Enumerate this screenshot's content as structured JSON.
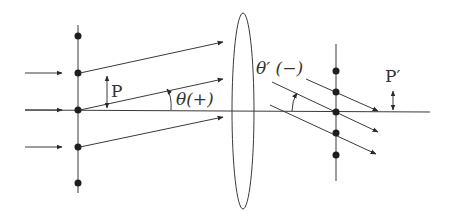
{
  "diagram": {
    "labels": {
      "period_object": "P",
      "angle_object": "θ(+)",
      "angle_image": "θ′ (−)",
      "period_image": "P′"
    },
    "colors": {
      "stroke": "#3a3a3a",
      "dot": "#1e1e1e",
      "background": "#ffffff"
    },
    "object_plane": {
      "x": 78,
      "dot_ys": [
        36,
        73,
        110,
        147,
        183
      ],
      "incident_arrow_ys": [
        73,
        110,
        147
      ]
    },
    "lens": {
      "cx": 243,
      "cy": 111,
      "rx": 11,
      "ry": 98
    },
    "image_plane": {
      "x": 336,
      "dot_ys": [
        71,
        92,
        112,
        133,
        155
      ]
    },
    "optical_axis_y": 111
  }
}
